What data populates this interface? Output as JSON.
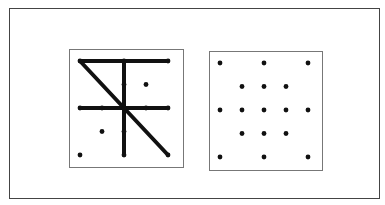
{
  "figure": {
    "colors": {
      "ink": "#111111",
      "frame": "#444444",
      "panel_border": "#777777",
      "background": "#ffffff"
    },
    "grid": {
      "cols": 5,
      "rows": 5
    }
  },
  "panels": [
    {
      "name": "left-panel",
      "box": {
        "x": 69,
        "y": 49,
        "w": 115,
        "h": 119
      },
      "origin": {
        "x": 80,
        "y": 61
      },
      "step": {
        "x": 22,
        "y": 23.5
      },
      "dots": [
        [
          0,
          0
        ],
        [
          2,
          0
        ],
        [
          4,
          0
        ],
        [
          2,
          1
        ],
        [
          3,
          1
        ],
        [
          0,
          2
        ],
        [
          1,
          2
        ],
        [
          2,
          2
        ],
        [
          3,
          2
        ],
        [
          4,
          2
        ],
        [
          1,
          3
        ],
        [
          2,
          3
        ],
        [
          0,
          4
        ],
        [
          2,
          4
        ],
        [
          4,
          4
        ]
      ],
      "lines": [
        {
          "from": [
            0,
            0
          ],
          "to": [
            4,
            0
          ]
        },
        {
          "from": [
            2,
            0
          ],
          "to": [
            2,
            4
          ]
        },
        {
          "from": [
            0,
            2
          ],
          "to": [
            4,
            2
          ]
        },
        {
          "from": [
            0,
            0
          ],
          "to": [
            4,
            4
          ]
        }
      ]
    },
    {
      "name": "right-panel",
      "box": {
        "x": 209,
        "y": 51,
        "w": 114,
        "h": 120
      },
      "origin": {
        "x": 220,
        "y": 63
      },
      "step": {
        "x": 22,
        "y": 23.5
      },
      "dots": [
        [
          0,
          0
        ],
        [
          2,
          0
        ],
        [
          4,
          0
        ],
        [
          1,
          1
        ],
        [
          2,
          1
        ],
        [
          3,
          1
        ],
        [
          0,
          2
        ],
        [
          1,
          2
        ],
        [
          2,
          2
        ],
        [
          3,
          2
        ],
        [
          4,
          2
        ],
        [
          1,
          3
        ],
        [
          2,
          3
        ],
        [
          3,
          3
        ],
        [
          0,
          4
        ],
        [
          2,
          4
        ],
        [
          4,
          4
        ]
      ],
      "lines": []
    }
  ]
}
